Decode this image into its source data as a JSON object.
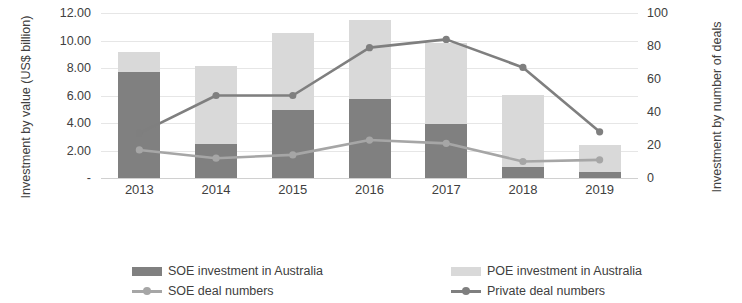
{
  "chart_data": {
    "type": "bar",
    "title": "",
    "subtitle": "",
    "xlabel": "",
    "ylabel": "Investment by value (US$ billion)",
    "y2label": "Investment by number of deals",
    "categories": [
      "2013",
      "2014",
      "2015",
      "2016",
      "2017",
      "2018",
      "2019"
    ],
    "ylim": [
      0,
      12
    ],
    "y2lim": [
      0,
      100
    ],
    "y_ticks": [
      "-",
      "2.00",
      "4.00",
      "6.00",
      "8.00",
      "10.00",
      "12.00"
    ],
    "y_tick_values": [
      0,
      2,
      4,
      6,
      8,
      10,
      12
    ],
    "y2_ticks": [
      "0",
      "20",
      "40",
      "60",
      "80",
      "100"
    ],
    "y2_tick_values": [
      0,
      20,
      40,
      60,
      80,
      100
    ],
    "grid": true,
    "legend_position": "bottom",
    "stacked": true,
    "series": [
      {
        "name": "SOE investment in Australia",
        "type": "bar",
        "axis": "left",
        "color": "#808080",
        "values": [
          7.7,
          2.5,
          4.95,
          5.75,
          3.95,
          0.8,
          0.45
        ]
      },
      {
        "name": "POE investment in Australia",
        "type": "bar",
        "axis": "left",
        "color": "#d9d9d9",
        "values": [
          1.5,
          5.65,
          5.6,
          5.75,
          5.85,
          5.25,
          1.95
        ]
      },
      {
        "name": "SOE deal numbers",
        "type": "line",
        "axis": "right",
        "color": "#a6a6a6",
        "values": [
          17,
          12,
          14,
          23,
          21,
          10,
          11
        ]
      },
      {
        "name": "Private deal numbers",
        "type": "line",
        "axis": "right",
        "color": "#7f7f7f",
        "values": [
          27,
          50,
          50,
          79,
          84,
          67,
          28
        ]
      }
    ],
    "totals": [
      9.2,
      8.15,
      10.55,
      11.5,
      9.8,
      6.05,
      2.4
    ]
  },
  "legend": {
    "items": [
      {
        "label": "SOE investment in Australia",
        "marker": "bar-swatch-dark"
      },
      {
        "label": "POE investment in Australia",
        "marker": "bar-swatch-light"
      },
      {
        "label": "SOE deal numbers",
        "marker": "line-swatch-light"
      },
      {
        "label": "Private deal numbers",
        "marker": "line-swatch-dark"
      }
    ]
  }
}
